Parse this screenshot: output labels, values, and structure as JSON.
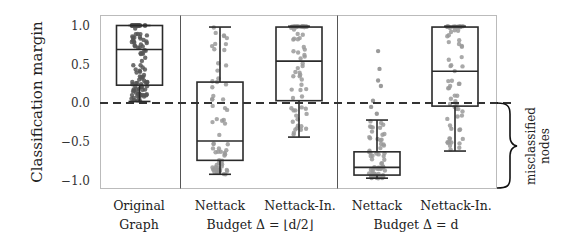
{
  "chart_data": {
    "type": "box",
    "title": "",
    "xlabel": "",
    "ylabel": "Classification margin",
    "ylim": [
      -1.1,
      1.1
    ],
    "yticks": [
      1.0,
      0.5,
      0.0,
      -0.5,
      -1.0
    ],
    "ytick_labels": [
      "1.0",
      "0.5",
      "0.0",
      "−0.5",
      "−1.0"
    ],
    "grid": false,
    "reference_line": {
      "y": 0.0,
      "style": "dashed"
    },
    "groups": [
      {
        "label_line1": "Original",
        "label_line2": "Graph",
        "boxes": [
          0
        ]
      },
      {
        "label_line2": "Budget Δ = ⌊d/2⌋",
        "boxes": [
          1,
          2
        ]
      },
      {
        "label_line2": "Budget Δ = d",
        "boxes": [
          3,
          4
        ]
      }
    ],
    "categories": [
      "Original Graph",
      "Nettack (Δ=⌊d/2⌋)",
      "Nettack-In. (Δ=⌊d/2⌋)",
      "Nettack (Δ=d)",
      "Nettack-In. (Δ=d)"
    ],
    "boxes": [
      {
        "label": "Original",
        "whisker_low": 0.02,
        "q1": 0.23,
        "median": 0.69,
        "q3": 1.0,
        "whisker_high": 1.0,
        "outliers": []
      },
      {
        "label": "Nettack",
        "whisker_low": -0.92,
        "q1": -0.74,
        "median": -0.49,
        "q3": 0.27,
        "whisker_high": 0.98,
        "outliers": []
      },
      {
        "label": "Nettack-In.",
        "whisker_low": -0.44,
        "q1": 0.03,
        "median": 0.54,
        "q3": 0.98,
        "whisker_high": 0.99,
        "outliers": []
      },
      {
        "label": "Nettack",
        "whisker_low": -0.97,
        "q1": -0.93,
        "median": -0.83,
        "q3": -0.63,
        "whisker_high": -0.22,
        "outliers": [
          -0.14,
          -0.05,
          0.03,
          0.22,
          0.29,
          0.44,
          0.67
        ]
      },
      {
        "label": "Nettack-In.",
        "whisker_low": -0.62,
        "q1": -0.04,
        "median": 0.41,
        "q3": 0.98,
        "whisker_high": 0.99,
        "outliers": []
      }
    ],
    "annotation": {
      "text_line1": "misclassified",
      "text_line2": "nodes",
      "range": [
        0.0,
        -1.1
      ],
      "style": "curly-brace"
    }
  },
  "labels": {
    "ylabel": "Classification margin",
    "yticks": [
      "1.0",
      "0.5",
      "0.0",
      "−0.5",
      "−1.0"
    ],
    "cat1_line1": "Original",
    "cat1_line2": "Graph",
    "cat2_line1": "Nettack",
    "cat3_line1": "Nettack-In.",
    "cat4_line1": "Nettack",
    "cat5_line1": "Nettack-In.",
    "group2_budget": "Budget Δ = ⌊d/2⌋",
    "group3_budget": "Budget Δ = d",
    "side_line1": "misclassified",
    "side_line2": "nodes"
  },
  "colors": {
    "box": "#2a2a2a",
    "points_dark": "#555555",
    "points_light": "#9a9a9a",
    "frame": "#bbbbbb",
    "dash": "#333333"
  }
}
